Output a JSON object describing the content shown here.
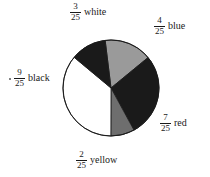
{
  "figure": {
    "background_color": "#ffffff",
    "outline_color": "#1a1a1a"
  },
  "chart_data": {
    "type": "pie",
    "title": "",
    "total": 25,
    "denominator": 25,
    "legend_position": "callouts",
    "grid": false,
    "center": {
      "x": 111,
      "y": 88
    },
    "radius": 48,
    "start_angle_deg": -7,
    "direction": "clockwise",
    "categories": [
      "blue",
      "red",
      "yellow",
      "black",
      "white"
    ],
    "values": [
      4,
      7,
      2,
      9,
      3
    ],
    "labels": [
      "4/25",
      "7/25",
      "2/25",
      "9/25",
      "3/25"
    ],
    "slices": [
      {
        "name": "blue",
        "numerator": "4",
        "denominator": "25",
        "label": "blue",
        "value": 4,
        "fraction": "4/25",
        "fill": "#9a9a9a",
        "stroke": "#1a1a1a",
        "angle_deg": 57.6
      },
      {
        "name": "red",
        "numerator": "7",
        "denominator": "25",
        "label": "red",
        "value": 7,
        "fraction": "7/25",
        "fill": "#1a1a1a",
        "stroke": "#1a1a1a",
        "angle_deg": 100.8
      },
      {
        "name": "yellow",
        "numerator": "2",
        "denominator": "25",
        "label": "yellow",
        "value": 2,
        "fraction": "2/25",
        "fill": "#6e6e6e",
        "stroke": "#1a1a1a",
        "angle_deg": 28.8
      },
      {
        "name": "black",
        "numerator": "9",
        "denominator": "25",
        "label": "black",
        "value": 9,
        "fraction": "9/25",
        "fill": "#ffffff",
        "stroke": "#1a1a1a",
        "angle_deg": 129.6
      },
      {
        "name": "white",
        "numerator": "3",
        "denominator": "25",
        "label": "white",
        "value": 3,
        "fraction": "3/25",
        "fill": "#1a1a1a",
        "stroke": "#1a1a1a",
        "angle_deg": 43.2
      }
    ],
    "xlabel": "",
    "ylabel": ""
  }
}
